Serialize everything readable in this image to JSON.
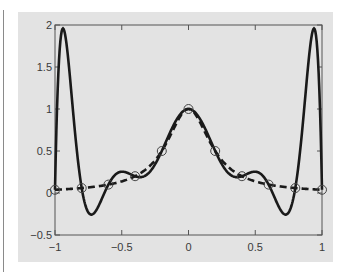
{
  "chart_data": {
    "type": "line",
    "title": "",
    "xlabel": "",
    "ylabel": "",
    "xlim": [
      -1,
      1
    ],
    "ylim": [
      -0.5,
      2
    ],
    "grid": false,
    "legend": null,
    "x_ticks": [
      -1,
      -0.5,
      0,
      0.5,
      1
    ],
    "x_tick_labels": [
      "−1",
      "−0.5",
      "0",
      "0.5",
      "1"
    ],
    "y_ticks": [
      -0.5,
      0,
      0.5,
      1,
      1.5,
      2
    ],
    "y_tick_labels": [
      "−0.5",
      "0",
      "0.5",
      "1",
      "1.5",
      "2"
    ],
    "nodes": {
      "x": [
        -1,
        -0.8,
        -0.6,
        -0.4,
        -0.2,
        0,
        0.2,
        0.4,
        0.6,
        0.8,
        1
      ],
      "y": [
        0.0385,
        0.0588,
        0.1,
        0.2,
        0.5,
        1,
        0.5,
        0.2,
        0.1,
        0.0588,
        0.0385
      ],
      "marker": "open-circle"
    },
    "series": [
      {
        "name": "Runge function 1/(1+25x^2)",
        "style": "dashed",
        "color": "#1a1a1a",
        "x": [
          -1,
          -0.9,
          -0.8,
          -0.7,
          -0.6,
          -0.5,
          -0.4,
          -0.3,
          -0.2,
          -0.1,
          0,
          0.1,
          0.2,
          0.3,
          0.4,
          0.5,
          0.6,
          0.7,
          0.8,
          0.9,
          1
        ],
        "values": [
          0.038,
          0.047,
          0.059,
          0.075,
          0.1,
          0.138,
          0.2,
          0.308,
          0.5,
          0.8,
          1,
          0.8,
          0.5,
          0.308,
          0.2,
          0.138,
          0.1,
          0.075,
          0.059,
          0.047,
          0.038
        ]
      },
      {
        "name": "Degree-10 interpolating polynomial",
        "style": "solid",
        "color": "#1a1a1a",
        "x": [
          -1,
          -0.96,
          -0.9,
          -0.8,
          -0.73,
          -0.6,
          -0.5,
          -0.4,
          -0.2,
          0,
          0.2,
          0.4,
          0.5,
          0.6,
          0.73,
          0.8,
          0.9,
          0.96,
          1
        ],
        "values": [
          0.038,
          1.92,
          1.58,
          0.059,
          -0.23,
          0.1,
          0.25,
          0.2,
          0.5,
          1,
          0.5,
          0.2,
          0.25,
          0.1,
          -0.23,
          0.059,
          1.58,
          1.92,
          0.038
        ]
      }
    ]
  },
  "colors": {
    "panel_background": "#e3e3e3",
    "page_background": "#ffffff",
    "line": "#1a1a1a",
    "axes": "#555555"
  }
}
